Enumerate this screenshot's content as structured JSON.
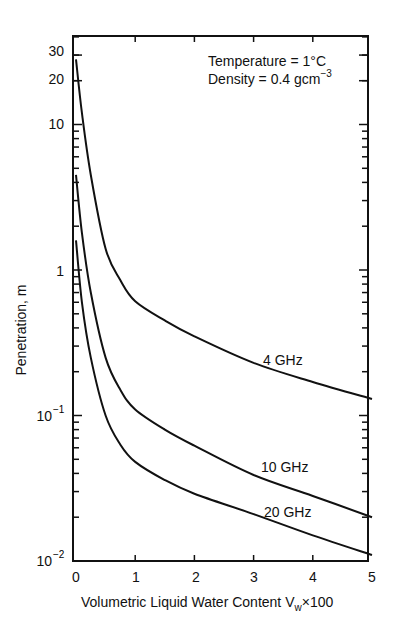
{
  "chart_data": {
    "type": "line",
    "title": "",
    "xlabel": "Volumetric Liquid Water Content V_w×100",
    "ylabel": "Penetration, m",
    "yscale": "log",
    "xlim": [
      0,
      5
    ],
    "ylim": [
      0.01,
      40
    ],
    "x_ticks": [
      "0",
      "1",
      "2",
      "3",
      "4",
      "5"
    ],
    "y_ticks": [
      "10^-2",
      "10^-1",
      "1",
      "10",
      "20",
      "30"
    ],
    "grid": false,
    "legend": "inline labels",
    "annotations": [
      "Temperature = 1°C",
      "Density = 0.4 gcm^-3"
    ],
    "series": [
      {
        "name": "4 GHz",
        "x": [
          0,
          0.1,
          0.25,
          0.5,
          0.75,
          1,
          1.5,
          2,
          3,
          4,
          5
        ],
        "values": [
          28,
          12,
          4.5,
          1.4,
          0.85,
          0.61,
          0.45,
          0.35,
          0.23,
          0.17,
          0.13
        ]
      },
      {
        "name": "10 GHz",
        "x": [
          0,
          0.1,
          0.25,
          0.5,
          0.75,
          1,
          1.5,
          2,
          3,
          4,
          5
        ],
        "values": [
          4.5,
          1.8,
          0.7,
          0.25,
          0.15,
          0.11,
          0.08,
          0.062,
          0.039,
          0.028,
          0.02
        ]
      },
      {
        "name": "20 GHz",
        "x": [
          0,
          0.1,
          0.25,
          0.5,
          0.75,
          1,
          1.5,
          2,
          3,
          4,
          5
        ],
        "values": [
          1.6,
          0.6,
          0.25,
          0.1,
          0.063,
          0.048,
          0.036,
          0.029,
          0.021,
          0.015,
          0.011
        ]
      }
    ]
  },
  "labels": {
    "annotation_line1": "Temperature = 1°C",
    "annotation_line2_base": "Density = 0.4 gcm",
    "annotation_line2_sup": "−3",
    "ylabel": "Penetration, m",
    "xlabel_main": "Volumetric Liquid Water Content V",
    "xlabel_sub": "w",
    "xlabel_tail": "×100",
    "series_4": "4 GHz",
    "series_10": "10 GHz",
    "series_20": "20 GHz",
    "x_ticks": [
      "0",
      "1",
      "2",
      "3",
      "4",
      "5"
    ],
    "y_tick_30": "30",
    "y_tick_20": "20",
    "y_tick_10": "10",
    "y_tick_1": "1",
    "y_tick_m1_base": "10",
    "y_tick_m1_exp": "−1",
    "y_tick_m2_base": "10",
    "y_tick_m2_exp": "−2"
  }
}
